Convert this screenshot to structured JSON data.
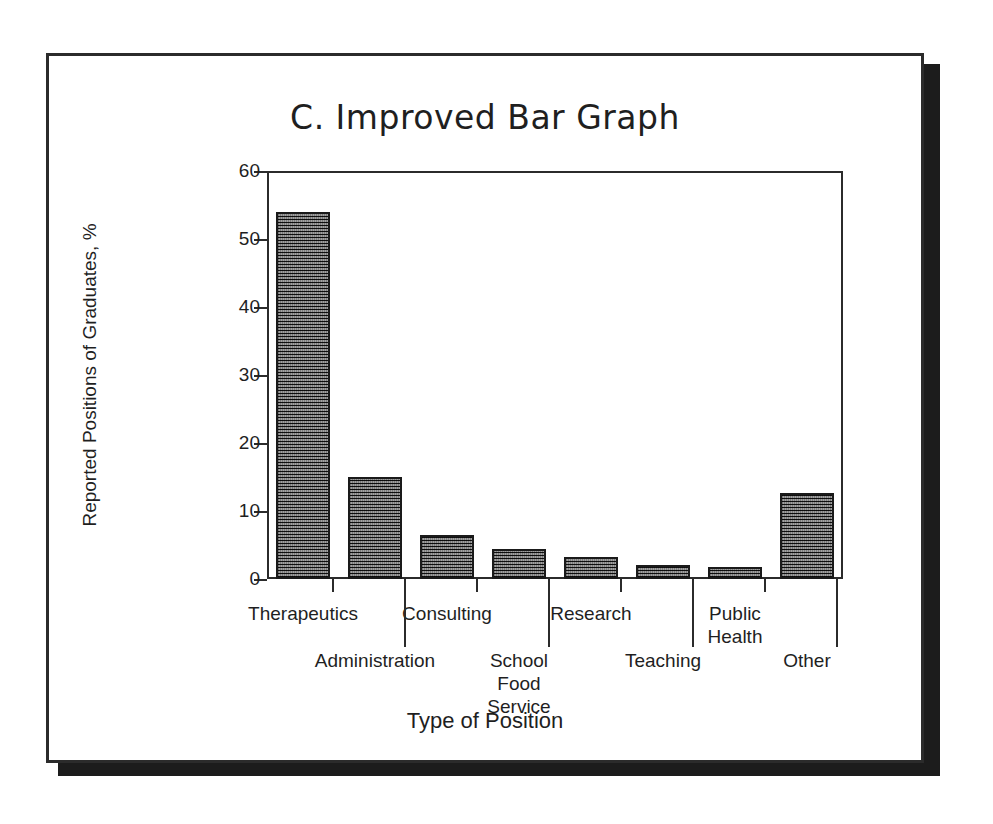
{
  "slide": {
    "title": "C. Improved Bar Graph"
  },
  "chart_data": {
    "type": "bar",
    "title": "C. Improved Bar Graph",
    "xlabel": "Type of Position",
    "ylabel": "Reported Positions of Graduates, %",
    "ylim": [
      0,
      60
    ],
    "yticks": [
      0,
      10,
      20,
      30,
      40,
      50,
      60
    ],
    "ytick_labels": [
      "0",
      "10",
      "20",
      "30",
      "40",
      "50",
      "60"
    ],
    "grid": false,
    "legend": null,
    "categories": [
      "Therapeutics",
      "Administration",
      "Consulting",
      "School\nFood\nService",
      "Research",
      "Teaching",
      "Public\nHealth",
      "Other"
    ],
    "values": [
      54,
      15,
      6.5,
      4.4,
      3.2,
      2.1,
      1.8,
      12.7
    ],
    "bar_color": "#6d6d6d",
    "bar_edge_color": "#1a1a1a",
    "axis_color": "#2b2b2b",
    "label_rows": [
      0,
      1,
      0,
      1,
      0,
      1,
      0,
      1
    ]
  }
}
